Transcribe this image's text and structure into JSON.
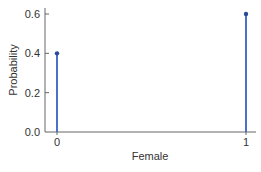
{
  "chart_data": {
    "type": "stem",
    "title": "",
    "xlabel": "Female",
    "ylabel": "Probability",
    "categories": [
      "0",
      "1"
    ],
    "x": [
      0,
      1
    ],
    "values": [
      0.4,
      0.6
    ],
    "ylim": [
      0.0,
      0.6
    ],
    "yticks": [
      "0.0",
      "0.2",
      "0.4",
      "0.6"
    ],
    "xticks": [
      "0",
      "1"
    ],
    "grid": false,
    "legend": null,
    "colors": {
      "stem": "#4a72c9",
      "marker": "#2a4a9a",
      "axis": "#555555"
    }
  }
}
